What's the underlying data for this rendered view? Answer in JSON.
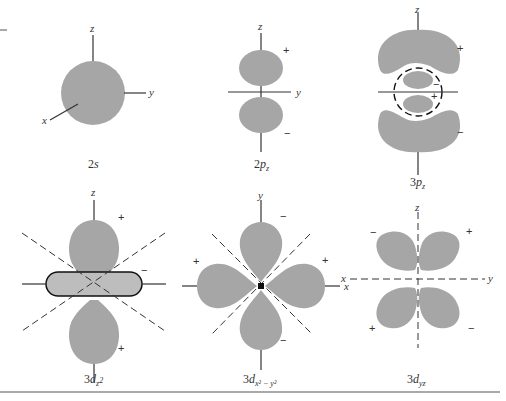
{
  "figure": {
    "colors": {
      "lobe": "#a6a6a6",
      "line": "#333333",
      "background": "#ffffff"
    },
    "panels": [
      {
        "id": "2s",
        "caption_main": "2",
        "caption_italic": "s",
        "caption_sub": "",
        "axes": [
          "z",
          "y",
          "x"
        ],
        "signs": []
      },
      {
        "id": "2pz",
        "caption_main": "2",
        "caption_italic": "p",
        "caption_sub": "z",
        "axes": [
          "z",
          "y"
        ],
        "signs": [
          "+",
          "−"
        ]
      },
      {
        "id": "3pz",
        "caption_main": "3",
        "caption_italic": "p",
        "caption_sub": "z",
        "axes": [
          "z"
        ],
        "signs": [
          "+",
          "−",
          "+",
          "−"
        ]
      },
      {
        "id": "3dz2",
        "caption_main": "3",
        "caption_italic": "d",
        "caption_sub": "z",
        "caption_sup": "2",
        "axes": [
          "z"
        ],
        "signs": [
          "+",
          "−",
          "+"
        ]
      },
      {
        "id": "3dx2-y2",
        "caption_main": "3",
        "caption_italic": "d",
        "caption_sub": "x² − y²",
        "axes": [
          "y",
          "x"
        ],
        "signs": [
          "−",
          "+",
          "+",
          "−"
        ]
      },
      {
        "id": "3dyz",
        "caption_main": "3",
        "caption_italic": "d",
        "caption_sub": "yz",
        "axes": [
          "z",
          "x",
          "y"
        ],
        "signs": [
          "−",
          "+",
          "+",
          "−"
        ]
      }
    ]
  }
}
